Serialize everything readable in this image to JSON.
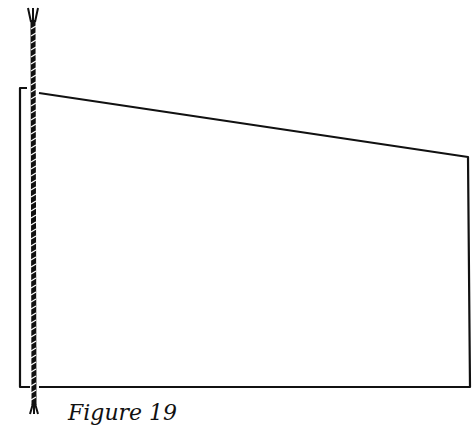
{
  "figure": {
    "caption": "Figure 19",
    "stroke_color": "#111111",
    "background": "#ffffff",
    "shape": "quadrilateral with cord along left edge",
    "elements": [
      "twisted-cord",
      "panel-outline"
    ]
  }
}
